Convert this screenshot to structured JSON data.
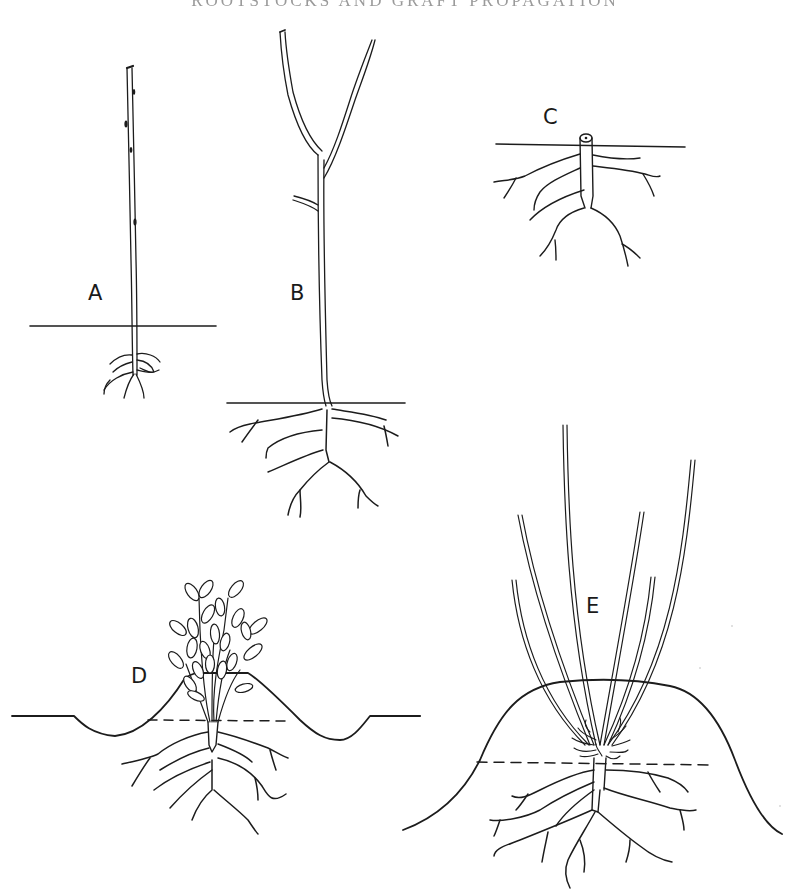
{
  "figure": {
    "title_partial": "ROOTSTOCKS AND GRAFT PROPAGATION",
    "title_visibility": "cropped at top edge, mostly illegible",
    "style": "black ink line drawing on white",
    "colors": {
      "ink": "#1c1c1c",
      "background": "#ffffff"
    }
  },
  "panels": [
    {
      "id": "A",
      "label": "A",
      "description": "single slender unbranched whip with small fibrous roots below soil line"
    },
    {
      "id": "B",
      "label": "B",
      "description": "taller stem forked at top into two branches with one side shoot, spreading roots below soil line"
    },
    {
      "id": "C",
      "label": "C",
      "description": "stem cut off at soil line showing root system only"
    },
    {
      "id": "D",
      "label": "D",
      "description": "leafy shoots growing from crown, soil mounded up around base; dashed line marks original soil level"
    },
    {
      "id": "E",
      "label": "E",
      "description": "several long shoots rising from a high soil mound, new roots formed at shoot bases above dashed original soil level"
    }
  ]
}
